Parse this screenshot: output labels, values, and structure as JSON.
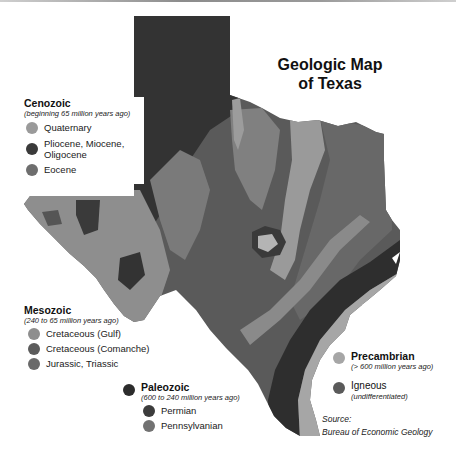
{
  "title": {
    "line1": "Geologic Map",
    "line2": "of Texas"
  },
  "colors": {
    "quaternary": "#9a9a9a",
    "pliocene_miocene_oligocene": "#3a3a3a",
    "eocene": "#6e6e6e",
    "cretaceous_gulf": "#8e8e8e",
    "cretaceous_comanche": "#5c5c5c",
    "jurassic_triassic": "#6a6a6a",
    "paleozoic": "#2c2c2c",
    "permian": "#3c3c3c",
    "pennsylvanian": "#727272",
    "precambrian": "#a6a6a6",
    "igneous": "#5a5a5a"
  },
  "legend": {
    "cenozoic": {
      "title": "Cenozoic",
      "subtitle": "(beginning 65 million years ago)",
      "items": [
        {
          "label": "Quaternary",
          "icon": "legend-dot-quaternary"
        },
        {
          "label": "Pliocene, Miocene, Oligocene",
          "line1": "Pliocene, Miocene,",
          "line2": "Oligocene",
          "icon": "legend-dot-pliocene"
        },
        {
          "label": "Eocene",
          "icon": "legend-dot-eocene"
        }
      ]
    },
    "mesozoic": {
      "title": "Mesozoic",
      "subtitle": "(240 to 65 million years ago)",
      "items": [
        {
          "label": "Cretaceous (Gulf)",
          "icon": "legend-dot-cretaceous-gulf"
        },
        {
          "label": "Cretaceous (Comanche)",
          "icon": "legend-dot-cretaceous-comanche"
        },
        {
          "label": "Jurassic, Triassic",
          "icon": "legend-dot-jurassic-triassic"
        }
      ]
    },
    "paleozoic": {
      "title": "Paleozoic",
      "subtitle": "(600 to 240 million years ago)",
      "items": [
        {
          "label": "Permian",
          "icon": "legend-dot-permian"
        },
        {
          "label": "Pennsylvanian",
          "icon": "legend-dot-pennsylvanian"
        }
      ]
    },
    "precambrian": {
      "title": "Precambrian",
      "subtitle": "(> 600 million years ago)"
    },
    "igneous": {
      "title": "Igneous",
      "subtitle": "(undifferentiated)"
    }
  },
  "source": {
    "label": "Source:",
    "text": "Bureau of Economic Geology"
  }
}
